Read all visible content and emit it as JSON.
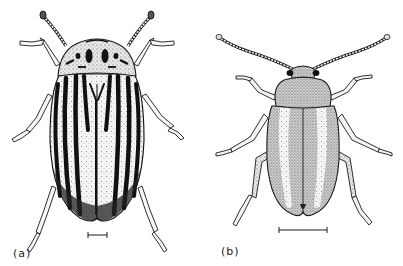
{
  "figure": {
    "panels": [
      {
        "id": "a",
        "label": "(a)",
        "subject": "striped-leaf-beetle-dorsal-view",
        "elytra_stripes": 10,
        "scale_bar": {
          "x1": 88,
          "x2": 107,
          "y": 235
        }
      },
      {
        "id": "b",
        "label": "(b)",
        "subject": "stippled-leaf-beetle-dorsal-view",
        "scale_bar": {
          "x1": 279,
          "x2": 327,
          "y": 230
        }
      }
    ],
    "colors": {
      "ink": "#1a1a1a",
      "stipple": "#8a8a8a",
      "paper": "#ffffff"
    }
  }
}
